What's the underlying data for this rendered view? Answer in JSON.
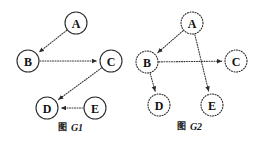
{
  "figure": {
    "background_color": "#ffffff",
    "stroke_color": "#2b2b2b",
    "edge_color": "#3a3a3a",
    "width": 258,
    "height": 146
  },
  "graphs": [
    {
      "id": "G1",
      "caption_prefix": "图",
      "caption_name": "G1",
      "caption_x": 72,
      "caption_y": 127,
      "node_style": "solid",
      "nodes": [
        {
          "id": "A",
          "label": "A",
          "cx": 76,
          "cy": 23,
          "r": 11
        },
        {
          "id": "B",
          "label": "B",
          "cx": 28,
          "cy": 61,
          "r": 11
        },
        {
          "id": "C",
          "label": "C",
          "cx": 111,
          "cy": 61,
          "r": 11
        },
        {
          "id": "D",
          "label": "D",
          "cx": 47,
          "cy": 108,
          "r": 11
        },
        {
          "id": "E",
          "label": "E",
          "cx": 95,
          "cy": 108,
          "r": 11
        }
      ],
      "edges": [
        {
          "from": "A",
          "to": "B",
          "directed": true
        },
        {
          "from": "B",
          "to": "C",
          "directed": true
        },
        {
          "from": "C",
          "to": "D",
          "directed": true
        },
        {
          "from": "E",
          "to": "D",
          "directed": true
        }
      ]
    },
    {
      "id": "G2",
      "caption_prefix": "图",
      "caption_name": "G2",
      "caption_x": 191,
      "caption_y": 126,
      "node_style": "dotted",
      "nodes": [
        {
          "id": "A",
          "label": "A",
          "cx": 192,
          "cy": 23,
          "r": 11
        },
        {
          "id": "B",
          "label": "B",
          "cx": 147,
          "cy": 62,
          "r": 11
        },
        {
          "id": "C",
          "label": "C",
          "cx": 236,
          "cy": 61,
          "r": 11
        },
        {
          "id": "D",
          "label": "D",
          "cx": 159,
          "cy": 105,
          "r": 11
        },
        {
          "id": "E",
          "label": "E",
          "cx": 212,
          "cy": 105,
          "r": 11
        }
      ],
      "edges": [
        {
          "from": "A",
          "to": "B",
          "directed": true
        },
        {
          "from": "B",
          "to": "C",
          "directed": true
        },
        {
          "from": "B",
          "to": "D",
          "directed": true
        },
        {
          "from": "A",
          "to": "E",
          "directed": true
        }
      ]
    }
  ]
}
